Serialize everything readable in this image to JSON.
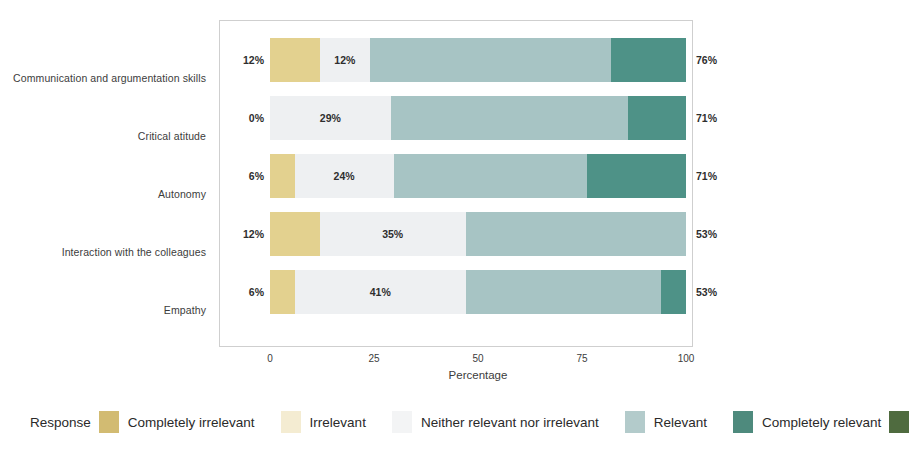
{
  "chart_data": {
    "type": "bar",
    "subtype": "diverging-stacked-bar",
    "title": "",
    "xlabel": "Percentage",
    "ylabel": "",
    "xlim": [
      0,
      100
    ],
    "xticks": [
      "0",
      "25",
      "50",
      "75",
      "100"
    ],
    "grid": false,
    "legend_position": "bottom",
    "legend_title": "Response",
    "categories": [
      "Communication and argumentation skills",
      "Critical atitude",
      "Autonomy",
      "Interaction with the colleagues",
      "Empathy"
    ],
    "series": [
      {
        "name": "Completely irrelevant",
        "color": "#e3d18f",
        "values": [
          12,
          0,
          6,
          12,
          6
        ]
      },
      {
        "name": "Irrelevant",
        "color": "#f6f1dd",
        "values": [
          0,
          0,
          0,
          0,
          0
        ]
      },
      {
        "name": "Neither relevant nor irrelevant",
        "color": "#eef0f2",
        "values": [
          12,
          29,
          24,
          35,
          41
        ]
      },
      {
        "name": "Relevant",
        "color": "#a7c4c4",
        "values": [
          58,
          57,
          47,
          53,
          47
        ]
      },
      {
        "name": "Completely relevant",
        "color": "#4e9287",
        "values": [
          18,
          14,
          24,
          0,
          6
        ]
      }
    ],
    "left_totals": [
      "12%",
      "0%",
      "6%",
      "12%",
      "6%"
    ],
    "right_totals": [
      "76%",
      "71%",
      "71%",
      "53%",
      "53%"
    ],
    "inner_labels": [
      "12%",
      "29%",
      "24%",
      "35%",
      "41%"
    ]
  },
  "legend": {
    "title": "Response",
    "items": [
      {
        "label": "Completely irrelevant",
        "color": "#d2bb72"
      },
      {
        "label": "Irrelevant",
        "color": "#f4ecd2"
      },
      {
        "label": "Neither relevant nor irrelevant",
        "color": "#f3f4f5"
      },
      {
        "label": "Relevant",
        "color": "#b3cbcb"
      },
      {
        "label": "Completely relevant",
        "color": "#4e8a7d"
      }
    ],
    "trailing_swatch_color": "#4f6b3f"
  },
  "colors": {
    "completely_irrelevant": "#e3d18f",
    "irrelevant": "#f6f1dd",
    "neither": "#eef0f2",
    "relevant": "#a7c4c4",
    "completely_relevant": "#4e9287",
    "legend_last_swatch": "#4f6b3f",
    "axis_text": "#3c3c3c",
    "frame": "#cfcfcf",
    "background": "#ffffff"
  }
}
